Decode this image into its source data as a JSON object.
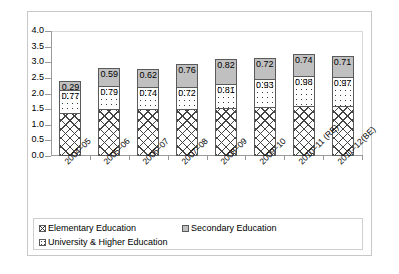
{
  "chart_data": {
    "type": "bar",
    "subtype": "stacked-bar",
    "title": "",
    "xlabel": "",
    "ylabel": "",
    "ylim": [
      0.0,
      4.0
    ],
    "ytick_step": 0.5,
    "ytick_labels": [
      "4.0",
      "3.5",
      "3.0",
      "2.5",
      "2.0",
      "1.5",
      "1.0",
      "0.5",
      "0.0"
    ],
    "grid": false,
    "legend_position": "bottom",
    "categories": [
      "2004–05",
      "2005–06",
      "2006–07",
      "2007–08",
      "2008–09",
      "2009–10",
      "2010–11 (RE)",
      "2011–12(BE)"
    ],
    "series": [
      {
        "name": "Elementary Education",
        "fill": "cross-hatch",
        "values": [
          1.39,
          1.49,
          1.5,
          1.52,
          1.54,
          1.56,
          1.61,
          1.6
        ],
        "labels_shown": false
      },
      {
        "name": "University & Higher Education",
        "fill": "dotted",
        "values": [
          0.77,
          0.79,
          0.74,
          0.72,
          0.81,
          0.93,
          0.98,
          0.97
        ],
        "labels": [
          "0.77",
          "0.79",
          "0.74",
          "0.72",
          "0.81",
          "0.93",
          "0.98",
          "0.97"
        ],
        "labels_shown": true
      },
      {
        "name": "Secondary Education",
        "fill": "solid-gray",
        "values": [
          0.29,
          0.59,
          0.62,
          0.76,
          0.82,
          0.72,
          0.74,
          0.71
        ],
        "labels": [
          "0.29",
          "0.59",
          "0.62",
          "0.76",
          "0.82",
          "0.72",
          "0.74",
          "0.71"
        ],
        "labels_shown": true
      }
    ],
    "totals": [
      2.45,
      2.87,
      2.86,
      3.0,
      3.17,
      3.21,
      3.33,
      3.28
    ]
  },
  "legend": {
    "items": [
      {
        "label": "Elementary Education",
        "key": "cross-hatch-swatch"
      },
      {
        "label": "Secondary Education",
        "key": "gray-swatch"
      },
      {
        "label": "University & Higher Education",
        "key": "dotted-swatch"
      }
    ]
  },
  "colors": {
    "secondary_fill": "#c0c0c0",
    "outline": "#5a5a5a",
    "axis": "#9a9a9a",
    "frame": "#c8c8c8",
    "text": "#000000",
    "background": "#ffffff"
  }
}
